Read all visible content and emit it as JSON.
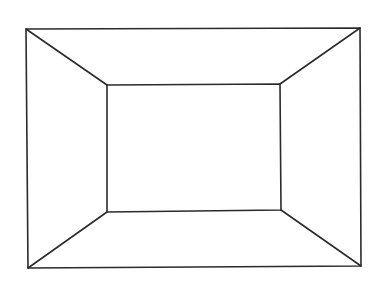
{
  "diagram": {
    "title": "",
    "stroke_color": "#2b2b2b",
    "background_color": "#ffffff",
    "shapes": [
      {
        "name": "outer-rectangle",
        "kind": "rectangle"
      },
      {
        "name": "inner-rectangle",
        "kind": "rectangle"
      },
      {
        "name": "diagonal-top-left",
        "kind": "line",
        "connects": [
          "outer.top-left",
          "inner.top-left"
        ]
      },
      {
        "name": "diagonal-top-right",
        "kind": "line",
        "connects": [
          "outer.top-right",
          "inner.top-right"
        ]
      },
      {
        "name": "diagonal-bottom-left",
        "kind": "line",
        "connects": [
          "outer.bottom-left",
          "inner.bottom-left"
        ]
      },
      {
        "name": "diagonal-bottom-right",
        "kind": "line",
        "connects": [
          "outer.bottom-right",
          "inner.bottom-right"
        ]
      }
    ],
    "labels": []
  }
}
